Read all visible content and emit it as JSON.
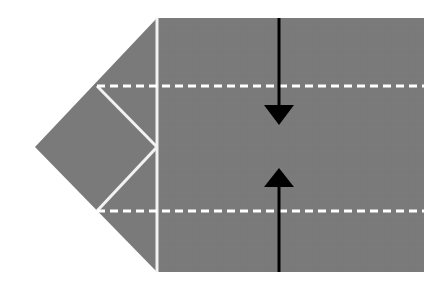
{
  "figure": {
    "type": "origami-fold-diagram",
    "title": "",
    "canvas": {
      "width": 445,
      "height": 296,
      "background": "#ffffff"
    },
    "colors": {
      "paper_gray": "#7a7a7a",
      "fold_line_white": "#f2f2f2",
      "crease_dashed": "#ffffff",
      "arrow_black": "#000000",
      "background": "#ffffff"
    },
    "shapes": {
      "paper_body": {
        "name": "paper-silhouette",
        "description": "Large gray rectangle with a triangular point extending to the left",
        "points": "157,18 424,18 424,272 157,272 35,147"
      },
      "right_panel": {
        "name": "right-rectangle-panel",
        "description": "Main rectangular panel of the folded paper",
        "x": 157,
        "y": 18,
        "width": 267,
        "height": 254
      },
      "left_point": {
        "name": "left-triangular-point",
        "description": "Triangular flap pointing left",
        "points": "157,18 35,147 157,272"
      }
    },
    "solid_fold_lines": [
      {
        "name": "vertical-fold-line",
        "description": "Vertical white fold line separating point from rectangle",
        "x1": 157,
        "y1": 18,
        "x2": 157,
        "y2": 272
      },
      {
        "name": "upper-diagonal-fold-line",
        "description": "Diagonal white fold line from upper crease down to the inner vertex",
        "x1": 97,
        "y1": 86,
        "x2": 157,
        "y2": 147
      },
      {
        "name": "lower-diagonal-fold-line",
        "description": "Diagonal white fold line from inner vertex down to lower crease",
        "x1": 157,
        "y1": 147,
        "x2": 97,
        "y2": 211
      }
    ],
    "dashed_crease_lines": [
      {
        "name": "upper-dashed-crease",
        "description": "Horizontal dashed valley crease across the upper third",
        "x1": 97,
        "y1": 86,
        "x2": 424,
        "y2": 86,
        "dash": "8 5",
        "width": 3
      },
      {
        "name": "lower-dashed-crease",
        "description": "Horizontal dashed valley crease across the lower third",
        "x1": 97,
        "y1": 211,
        "x2": 424,
        "y2": 211,
        "dash": "8 5",
        "width": 3
      }
    ],
    "arrows": [
      {
        "name": "fold-down-arrow",
        "direction": "down",
        "description": "Black arrow pointing down, indicating the top edge folds downward",
        "shaft": {
          "x1": 279,
          "y1": 18,
          "x2": 279,
          "y2": 110
        },
        "head": "264,105 294,105 279,125"
      },
      {
        "name": "fold-up-arrow",
        "direction": "up",
        "description": "Black arrow pointing up, indicating the bottom edge folds upward",
        "shaft": {
          "x1": 279,
          "y1": 272,
          "x2": 279,
          "y2": 180
        },
        "head": "264,187 294,187 279,168"
      }
    ]
  }
}
